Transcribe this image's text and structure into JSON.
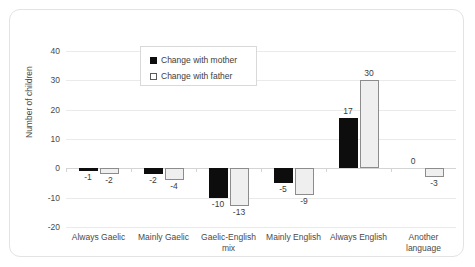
{
  "chart_data": {
    "type": "bar",
    "title": "",
    "xlabel": "",
    "ylabel": "Number of children",
    "ylim": [
      -20,
      40
    ],
    "yticks": [
      40,
      30,
      20,
      10,
      0,
      -10,
      -20
    ],
    "ytick_labels": [
      "40",
      "30",
      "20",
      "10",
      "0",
      "-10",
      "-20"
    ],
    "grid": true,
    "legend_position": "top-center-inside",
    "categories": [
      "Always Gaelic",
      "Mainly Gaelic",
      "Gaelic-English\nmix",
      "Mainly English",
      "Always English",
      "Another\nlanguage"
    ],
    "series": [
      {
        "name": "Change with mother",
        "color": "#0d0d0d",
        "values": [
          -1,
          -2,
          -10,
          -5,
          17,
          0
        ],
        "labels": [
          "-1",
          "-2",
          "-10",
          "-5",
          "17",
          "0"
        ]
      },
      {
        "name": "Change with father",
        "color": "#efefef",
        "border_color": "#8c8c8c",
        "values": [
          -2,
          -4,
          -13,
          -9,
          30,
          -3
        ],
        "labels": [
          "-2",
          "-4",
          "-13",
          "-9",
          "30",
          "-3"
        ]
      }
    ]
  },
  "colors": {
    "mother": "#0d0d0d",
    "father_fill": "#efefef",
    "father_border": "#8c8c8c",
    "gridline": "#eaeaea",
    "axis_text": "#4a4a4a",
    "card_border": "#e3e3e3"
  }
}
